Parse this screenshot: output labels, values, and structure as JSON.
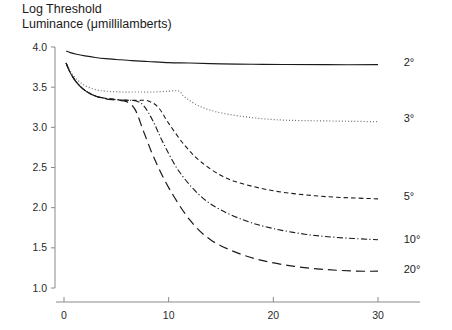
{
  "title": {
    "line1": "Log Threshold",
    "line2": "Luminance (μmillilamberts)"
  },
  "chart_data": {
    "type": "line",
    "title": "Log Threshold Luminance (μmillilamberts)",
    "subtitle": "",
    "xlabel": "",
    "ylabel": "Log Threshold Luminance (μmillilamberts)",
    "xlim": [
      0,
      35
    ],
    "ylim": [
      1.0,
      4.0
    ],
    "xticks": [
      0,
      10,
      20,
      30
    ],
    "xtick_labels": [
      "0",
      "10",
      "20",
      "30"
    ],
    "yticks": [
      1.0,
      1.5,
      2.0,
      2.5,
      3.0,
      3.5,
      4.0
    ],
    "ytick_labels": [
      "1.0",
      "1.5",
      "2.0",
      "2.5",
      "3.0",
      "3.5",
      "4.0"
    ],
    "grid": false,
    "legend_position": "right-inline",
    "legend_entries": [
      "2°",
      "3°",
      "5°",
      "10°",
      "20°"
    ],
    "annotations": [
      {
        "text": "2°",
        "x": 31.5,
        "y": 3.81
      },
      {
        "text": "3°",
        "x": 31.5,
        "y": 3.11
      },
      {
        "text": "5°",
        "x": 31.5,
        "y": 2.14
      },
      {
        "text": "10°",
        "x": 31.5,
        "y": 1.61
      },
      {
        "text": "20°",
        "x": 31.5,
        "y": 1.24
      }
    ],
    "series": [
      {
        "name": "2°",
        "label": "2°",
        "style": "solid",
        "color": "#1a1a1a",
        "x": [
          0.2,
          0.6,
          1.2,
          2.0,
          3.0,
          4.0,
          5.0,
          6.5,
          8.0,
          10.0,
          12.0,
          15.0,
          18.0,
          21.0,
          25.0,
          30.0
        ],
        "y": [
          3.95,
          3.93,
          3.91,
          3.89,
          3.87,
          3.855,
          3.845,
          3.83,
          3.82,
          3.805,
          3.8,
          3.79,
          3.785,
          3.782,
          3.78,
          3.78
        ]
      },
      {
        "name": "3°",
        "label": "3°",
        "style": "dotted",
        "color": "#6e6e6e",
        "x": [
          0.2,
          0.6,
          1.2,
          2.0,
          3.0,
          4.0,
          5.5,
          7.0,
          8.5,
          10.0,
          11.0,
          11.5,
          13.0,
          15.0,
          18.0,
          21.0,
          25.0,
          30.0
        ],
        "y": [
          3.8,
          3.7,
          3.6,
          3.52,
          3.47,
          3.45,
          3.44,
          3.44,
          3.44,
          3.45,
          3.45,
          3.38,
          3.26,
          3.18,
          3.12,
          3.09,
          3.08,
          3.07
        ]
      },
      {
        "name": "5°",
        "label": "5°",
        "style": "dashed-short",
        "color": "#1a1a1a",
        "x": [
          0.2,
          0.6,
          1.2,
          2.0,
          3.0,
          4.0,
          5.5,
          7.0,
          8.0,
          9.0,
          10.0,
          11.5,
          13.0,
          15.0,
          17.0,
          20.0,
          23.0,
          26.0,
          30.0
        ],
        "y": [
          3.8,
          3.68,
          3.56,
          3.46,
          3.39,
          3.36,
          3.34,
          3.335,
          3.33,
          3.25,
          3.05,
          2.78,
          2.58,
          2.4,
          2.3,
          2.21,
          2.16,
          2.13,
          2.11
        ]
      },
      {
        "name": "10°",
        "label": "10°",
        "style": "dash-dot",
        "color": "#1a1a1a",
        "x": [
          0.2,
          0.6,
          1.2,
          2.0,
          3.0,
          4.0,
          5.5,
          6.8,
          7.6,
          8.5,
          9.5,
          11.0,
          13.0,
          15.0,
          17.5,
          20.0,
          23.0,
          26.0,
          30.0
        ],
        "y": [
          3.8,
          3.68,
          3.56,
          3.46,
          3.39,
          3.36,
          3.34,
          3.33,
          3.27,
          3.08,
          2.8,
          2.45,
          2.15,
          1.97,
          1.83,
          1.74,
          1.67,
          1.63,
          1.6
        ]
      },
      {
        "name": "20°",
        "label": "20°",
        "style": "dashed-long",
        "color": "#1a1a1a",
        "x": [
          0.2,
          0.6,
          1.2,
          2.0,
          3.0,
          4.0,
          5.0,
          6.0,
          6.8,
          7.6,
          8.6,
          10.0,
          12.0,
          14.0,
          16.5,
          19.0,
          22.0,
          25.0,
          28.0,
          30.0
        ],
        "y": [
          3.8,
          3.68,
          3.56,
          3.46,
          3.39,
          3.355,
          3.34,
          3.32,
          3.22,
          2.95,
          2.62,
          2.25,
          1.85,
          1.6,
          1.44,
          1.34,
          1.27,
          1.23,
          1.21,
          1.21
        ]
      }
    ]
  }
}
